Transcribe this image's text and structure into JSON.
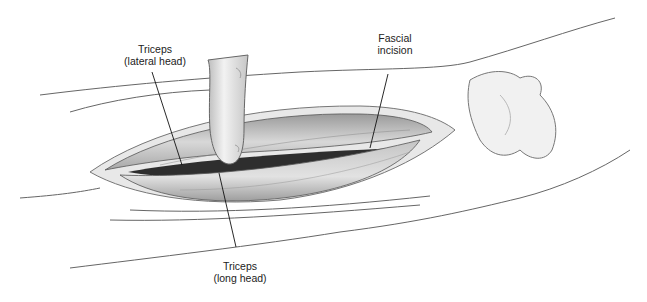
{
  "figure": {
    "labels": [
      {
        "id": "lateral",
        "line1": "Triceps",
        "line2": "(lateral head)"
      },
      {
        "id": "fascial",
        "line1": "Fascial",
        "line2": "incision"
      },
      {
        "id": "long",
        "line1": "Triceps",
        "line2": "(long head)"
      }
    ]
  },
  "colors": {
    "background": "#ffffff",
    "outline": "#555555",
    "skin_shade": "#e6e6e6",
    "muscle_shade": "#cfcfcf",
    "cavity": "#2e2e2e",
    "label_text": "#222222",
    "leader_line": "#111111"
  }
}
